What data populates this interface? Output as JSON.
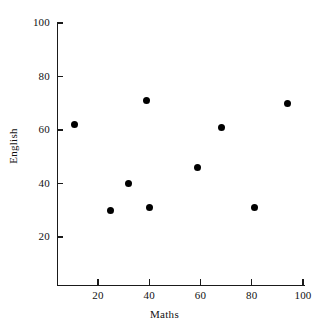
{
  "chart_data": {
    "type": "scatter",
    "title": "",
    "xlabel": "Maths",
    "ylabel": "English",
    "xlim": [
      0,
      100
    ],
    "ylim": [
      0,
      100
    ],
    "xticks": [
      20,
      40,
      60,
      80,
      100
    ],
    "yticks": [
      20,
      40,
      60,
      80,
      100
    ],
    "xtick_labels": [
      "20",
      "40",
      "60",
      "80",
      "100"
    ],
    "ytick_labels": [
      "20",
      "40",
      "60",
      "80",
      "100"
    ],
    "grid": false,
    "legend": null,
    "marker": "filled-circle",
    "marker_color": "#000000",
    "points": [
      {
        "x": 11,
        "y": 62
      },
      {
        "x": 25,
        "y": 30
      },
      {
        "x": 32,
        "y": 40
      },
      {
        "x": 39,
        "y": 71
      },
      {
        "x": 40,
        "y": 31
      },
      {
        "x": 59,
        "y": 46
      },
      {
        "x": 68,
        "y": 61
      },
      {
        "x": 81,
        "y": 31
      },
      {
        "x": 94,
        "y": 70
      }
    ],
    "series": [
      {
        "name": "students",
        "x": [
          11,
          25,
          32,
          39,
          40,
          59,
          68,
          81,
          94
        ],
        "y": [
          62,
          30,
          40,
          71,
          31,
          46,
          61,
          31,
          70
        ]
      }
    ]
  },
  "axes": {
    "x_title": "Maths",
    "y_title": "English"
  }
}
